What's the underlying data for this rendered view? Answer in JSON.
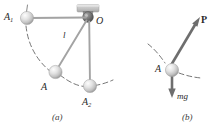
{
  "figure": {
    "panels": [
      {
        "id": "panel-a",
        "caption": "(a)",
        "labels": {
          "a1_base": "A",
          "a1_sub": "1",
          "a2_base": "A",
          "a2_sub": "2",
          "a": "A",
          "o": "O",
          "length": "l"
        },
        "elements": {
          "support_bracket": "ceiling-bracket",
          "pivot": "pivot-hinge",
          "string_upper": "string-O-to-A1",
          "string_cord": "cord-O-to-A",
          "string_vertical": "cord-O-to-A2",
          "arc_path": "dashed-swing-arc",
          "bobs": [
            "bob-A1",
            "bob-A",
            "bob-A2"
          ]
        }
      },
      {
        "id": "panel-b",
        "caption": "(b)",
        "labels": {
          "a": "A",
          "force_p": "P",
          "force_mg": "mg"
        },
        "elements": {
          "arrow_p": "force-vector-P",
          "arrow_mg": "weight-vector-mg",
          "arc_path": "dashed-swing-arc",
          "bobs": [
            "bob-A"
          ]
        }
      }
    ],
    "colors": {
      "line": "#8c8c8c",
      "line_dark": "#5a5a5a",
      "arrow": "#6b6b6b",
      "bob_light": "#f2f2f2",
      "bob_mid": "#cfcfcf",
      "bob_dark": "#9a9a9a",
      "bracket": "#bdbdbd",
      "pivot": "#6e6e6e",
      "text": "#2b2b2b",
      "background": "#ffffff"
    },
    "geometry": {
      "pivot_O": [
        88,
        17
      ],
      "bob_A1": [
        27,
        18
      ],
      "bob_A": [
        55,
        72
      ],
      "bob_A2": [
        90,
        86
      ],
      "bob_B": [
        172,
        70
      ],
      "arrow_P_tip": [
        199,
        18
      ],
      "arrow_mg_tip": [
        172,
        97
      ]
    }
  }
}
